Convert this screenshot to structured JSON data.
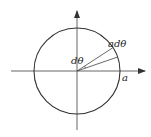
{
  "diagram": {
    "type": "circle-polar-element",
    "center": [
      77,
      71
    ],
    "radius": 43,
    "colors": {
      "stroke": "#333333",
      "axis": "#555555",
      "text": "#222222"
    },
    "axes": {
      "horizontal": {
        "from": [
          11,
          71
        ],
        "to": [
          145,
          71
        ],
        "arrow": "right"
      },
      "vertical": {
        "from": [
          77,
          130
        ],
        "to": [
          77,
          11
        ],
        "arrow": "up"
      }
    },
    "rays_deg": [
      19,
      33
    ],
    "labels": {
      "arc_length": "adθ",
      "angle": "dθ",
      "radius": "a"
    }
  }
}
